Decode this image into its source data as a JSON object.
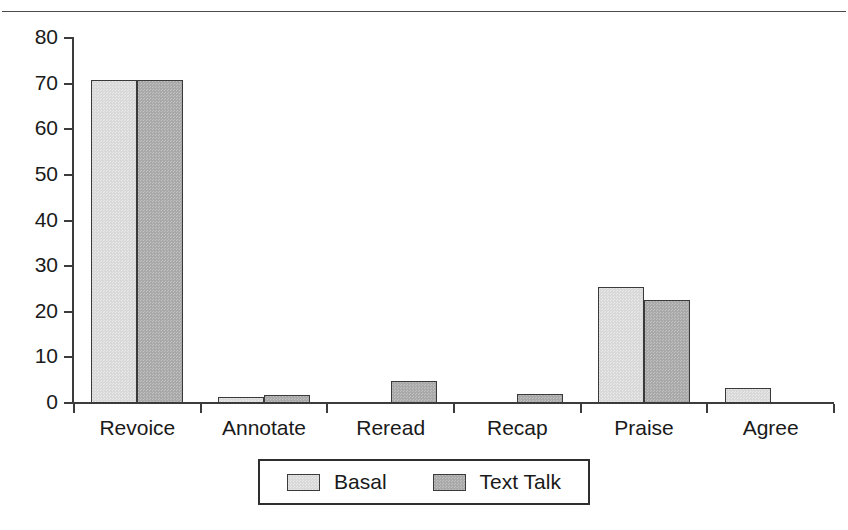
{
  "page": {
    "running_head": ""
  },
  "chart_data": {
    "type": "bar",
    "title": "",
    "xlabel": "",
    "ylabel": "",
    "ylim": [
      0,
      80
    ],
    "yticks": [
      0,
      10,
      20,
      30,
      40,
      50,
      60,
      70,
      80
    ],
    "grid": false,
    "legend_position": "bottom",
    "categories": [
      "Revoice",
      "Annotate",
      "Reread",
      "Recap",
      "Praise",
      "Agree"
    ],
    "series": [
      {
        "name": "Basal",
        "color": "#d9d9d9",
        "values": [
          70.8,
          1.3,
          0,
          0,
          25.4,
          3.3
        ]
      },
      {
        "name": "Text Talk",
        "color": "#a9a9a9",
        "values": [
          70.8,
          1.8,
          4.8,
          2.0,
          22.6,
          0
        ]
      }
    ]
  }
}
